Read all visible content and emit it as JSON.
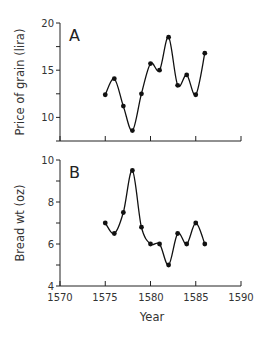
{
  "chart_data": [
    {
      "type": "line",
      "panel_label": "A",
      "title": "",
      "xlabel": "",
      "ylabel": "Price of grain (lira)",
      "x": [
        1575,
        1576,
        1577,
        1578,
        1579,
        1580,
        1581,
        1582,
        1583,
        1584,
        1585,
        1586
      ],
      "series": [
        {
          "name": "Price of grain",
          "values": [
            12.4,
            14.1,
            11.2,
            8.6,
            12.5,
            15.7,
            15.0,
            18.5,
            13.4,
            14.5,
            12.4,
            16.8
          ]
        }
      ],
      "xlim": [
        1570,
        1590
      ],
      "ylim": [
        7.5,
        20
      ],
      "yticks": [
        10,
        15,
        20
      ],
      "yminor_ticks": [
        12.5,
        17.5
      ],
      "xticks": [
        1570,
        1575,
        1580,
        1585,
        1590
      ],
      "xtick_labels_shown": false,
      "smooth": true,
      "grid": false,
      "legend": false
    },
    {
      "type": "line",
      "panel_label": "B",
      "title": "",
      "xlabel": "Year",
      "ylabel": "Bread wt (oz)",
      "x": [
        1575,
        1576,
        1577,
        1578,
        1579,
        1580,
        1581,
        1582,
        1583,
        1584,
        1585,
        1586
      ],
      "series": [
        {
          "name": "Bread weight",
          "values": [
            7.0,
            6.5,
            7.5,
            9.5,
            6.8,
            6.0,
            6.0,
            5.0,
            6.5,
            6.0,
            7.0,
            6.0
          ]
        }
      ],
      "xlim": [
        1570,
        1590
      ],
      "ylim": [
        4,
        10
      ],
      "yticks": [
        4,
        6,
        8,
        10
      ],
      "yminor_ticks": [
        5,
        7,
        9
      ],
      "xticks": [
        1570,
        1575,
        1580,
        1585,
        1590
      ],
      "xtick_labels_shown": true,
      "smooth": true,
      "grid": false,
      "legend": false
    }
  ],
  "panels": {
    "a": {
      "label": "A",
      "ylabel": "Price of grain (lira)",
      "yticks": [
        "20",
        "15",
        "10"
      ]
    },
    "b": {
      "label": "B",
      "ylabel": "Bread wt (oz)",
      "yticks": [
        "10",
        "8",
        "6",
        "4"
      ],
      "xlabel": "Year",
      "xticks": [
        "1570",
        "1575",
        "1580",
        "1585",
        "1590"
      ]
    }
  }
}
